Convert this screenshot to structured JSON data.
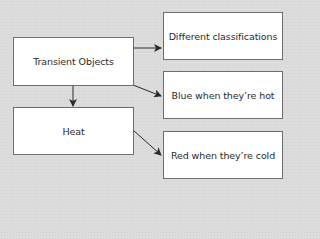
{
  "diagram": {
    "nodes": [
      {
        "id": "transient",
        "label": "Transient Objects"
      },
      {
        "id": "heat",
        "label": "Heat"
      },
      {
        "id": "classifications",
        "label": "Different classifications"
      },
      {
        "id": "blue",
        "label": "Blue when they’re hot"
      },
      {
        "id": "red",
        "label": "Red when they’re cold"
      }
    ],
    "edges": [
      {
        "from": "transient",
        "to": "classifications"
      },
      {
        "from": "transient",
        "to": "blue"
      },
      {
        "from": "transient",
        "to": "heat"
      },
      {
        "from": "heat",
        "to": "red"
      }
    ],
    "colors": {
      "background": "#dcdcdc",
      "box_fill": "#ffffff",
      "box_border": "#6e6e6e",
      "arrow": "#2a2a2a"
    }
  }
}
